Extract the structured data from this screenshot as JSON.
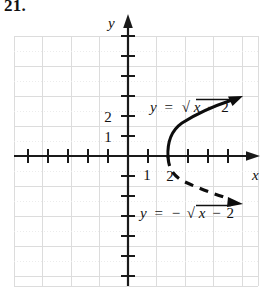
{
  "problem": {
    "number": "21."
  },
  "axes": {
    "x_label": "x",
    "y_label": "y",
    "x_ticks": [
      {
        "value": 1,
        "label": "1"
      },
      {
        "value": 2,
        "label": "2"
      }
    ],
    "y_ticks": [
      {
        "value": 1,
        "label": "1"
      },
      {
        "value": 2,
        "label": "2"
      }
    ],
    "grid": true,
    "grid_color": "#d8d8d8",
    "axis_color": "#1a1a1a",
    "xlim": [
      -5,
      5
    ],
    "ylim": [
      -5.5,
      5.5
    ]
  },
  "curves": [
    {
      "name": "upper-branch",
      "label": "y = √x − 2",
      "label_parts": {
        "lhs": "y",
        "equals": "=",
        "sign": "",
        "radicand_var": "x",
        "minus": "−",
        "radicand_num": "2"
      },
      "style": "solid",
      "equation": "y = sqrt(x - 2)",
      "domain_start": 2,
      "points": [
        [
          2,
          0
        ],
        [
          2.2,
          0.45
        ],
        [
          2.6,
          0.77
        ],
        [
          3.2,
          1.1
        ],
        [
          4.0,
          1.41
        ],
        [
          5.0,
          1.73
        ]
      ],
      "arrow": true,
      "color": "#0d0d0d"
    },
    {
      "name": "lower-branch",
      "label": "y = −√x − 2",
      "label_parts": {
        "lhs": "y",
        "equals": "=",
        "sign": "−",
        "radicand_var": "x",
        "minus": "−",
        "radicand_num": "2"
      },
      "style": "dashed",
      "equation": "y = -sqrt(x - 2)",
      "domain_start": 2,
      "points": [
        [
          2,
          0
        ],
        [
          2.2,
          -0.45
        ],
        [
          2.6,
          -0.77
        ],
        [
          3.2,
          -1.1
        ],
        [
          4.0,
          -1.41
        ],
        [
          5.0,
          -1.73
        ]
      ],
      "arrow": true,
      "color": "#0d0d0d"
    }
  ],
  "annotations": {
    "upper_label_text": "y = √ x − 2",
    "lower_label_text": "y = −√ x − 2"
  }
}
